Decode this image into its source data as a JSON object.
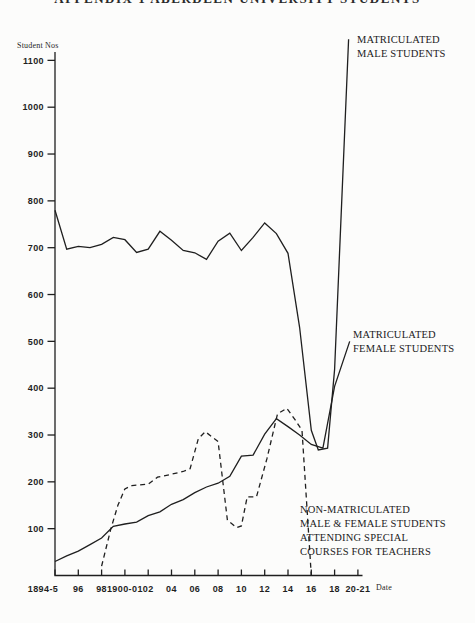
{
  "title": "APPENDIX 1   ABERDEEN UNIVERSITY STUDENTS",
  "labels": {
    "y_axis": "Student Nos",
    "x_axis": "Date",
    "male": "MATRICULATED\nMALE STUDENTS",
    "female": "MATRICULATED\nFEMALE STUDENTS",
    "nonmatric": "NON-MATRICULATED\nMALE & FEMALE STUDENTS\nATTENDING SPECIAL\nCOURSES FOR TEACHERS"
  },
  "colors": {
    "ink": "#1f1f1f",
    "background": "#fcfcfb"
  },
  "chart_data": {
    "type": "line",
    "title": "APPENDIX 1   ABERDEEN UNIVERSITY STUDENTS",
    "ylabel": "Student Nos",
    "xlabel": "Date",
    "ylim": [
      0,
      1150
    ],
    "xlim": [
      1894,
      1921
    ],
    "grid": false,
    "legend_position": "inline-annotations",
    "y_ticks": [
      100,
      200,
      300,
      400,
      500,
      600,
      700,
      800,
      900,
      1000,
      1100
    ],
    "x_ticks": [
      {
        "year": 1894,
        "label": "1894-5"
      },
      {
        "year": 1896,
        "label": "96"
      },
      {
        "year": 1898,
        "label": "98"
      },
      {
        "year": 1900,
        "label": "1900-01"
      },
      {
        "year": 1902,
        "label": "02"
      },
      {
        "year": 1904,
        "label": "04"
      },
      {
        "year": 1906,
        "label": "06"
      },
      {
        "year": 1908,
        "label": "08"
      },
      {
        "year": 1910,
        "label": "10"
      },
      {
        "year": 1912,
        "label": "12"
      },
      {
        "year": 1914,
        "label": "14"
      },
      {
        "year": 1916,
        "label": "16"
      },
      {
        "year": 1918,
        "label": "18"
      },
      {
        "year": 1920,
        "label": "20-21"
      }
    ],
    "series": [
      {
        "name": "Matriculated male students",
        "style": "solid",
        "points": [
          [
            1894,
            780
          ],
          [
            1895,
            697
          ],
          [
            1896,
            703
          ],
          [
            1897,
            700
          ],
          [
            1898,
            707
          ],
          [
            1899,
            722
          ],
          [
            1900,
            717
          ],
          [
            1901,
            690
          ],
          [
            1902,
            697
          ],
          [
            1903,
            735
          ],
          [
            1904,
            716
          ],
          [
            1905,
            694
          ],
          [
            1906,
            689
          ],
          [
            1907,
            675
          ],
          [
            1908,
            714
          ],
          [
            1909,
            731
          ],
          [
            1910,
            694
          ],
          [
            1911,
            722
          ],
          [
            1912,
            753
          ],
          [
            1913,
            730
          ],
          [
            1914,
            688
          ],
          [
            1915,
            530
          ],
          [
            1916,
            310
          ],
          [
            1916.6,
            268
          ],
          [
            1917.4,
            272
          ],
          [
            1918,
            440
          ],
          [
            1919.2,
            1145
          ]
        ]
      },
      {
        "name": "Matriculated female students",
        "style": "solid",
        "points": [
          [
            1894,
            30
          ],
          [
            1895,
            42
          ],
          [
            1896,
            52
          ],
          [
            1897,
            66
          ],
          [
            1898,
            80
          ],
          [
            1899,
            105
          ],
          [
            1900,
            110
          ],
          [
            1901,
            114
          ],
          [
            1902,
            128
          ],
          [
            1903,
            136
          ],
          [
            1904,
            152
          ],
          [
            1905,
            162
          ],
          [
            1906,
            177
          ],
          [
            1907,
            189
          ],
          [
            1908,
            197
          ],
          [
            1909,
            212
          ],
          [
            1910,
            255
          ],
          [
            1911,
            257
          ],
          [
            1912,
            302
          ],
          [
            1913,
            335
          ],
          [
            1914,
            318
          ],
          [
            1915,
            300
          ],
          [
            1916,
            280
          ],
          [
            1917,
            272
          ],
          [
            1918,
            404
          ],
          [
            1919.3,
            500
          ]
        ]
      },
      {
        "name": "Non-matriculated male and female students attending special courses for teachers",
        "style": "dashed",
        "points": [
          [
            1898,
            20
          ],
          [
            1898.8,
            100
          ],
          [
            1899.4,
            150
          ],
          [
            1900,
            185
          ],
          [
            1900.6,
            192
          ],
          [
            1902,
            195
          ],
          [
            1902.8,
            210
          ],
          [
            1903.8,
            215
          ],
          [
            1905,
            222
          ],
          [
            1905.6,
            228
          ],
          [
            1906.3,
            292
          ],
          [
            1906.9,
            307
          ],
          [
            1908,
            286
          ],
          [
            1908.8,
            118
          ],
          [
            1909.6,
            102
          ],
          [
            1910,
            106
          ],
          [
            1910.5,
            168
          ],
          [
            1911.3,
            168
          ],
          [
            1912.2,
            250
          ],
          [
            1913.1,
            345
          ],
          [
            1913.9,
            357
          ],
          [
            1914.6,
            333
          ],
          [
            1915.2,
            310
          ],
          [
            1916,
            0
          ]
        ]
      }
    ]
  }
}
